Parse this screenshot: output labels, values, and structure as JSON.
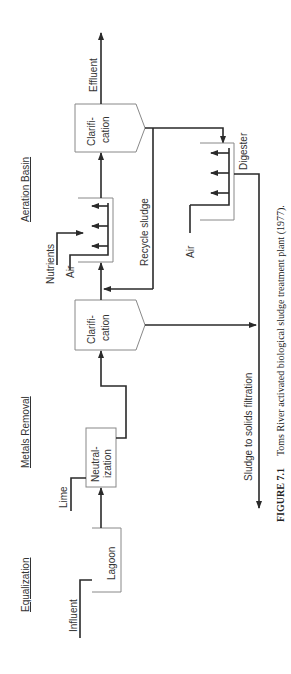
{
  "sections": {
    "equalization": "Equalization",
    "metals_removal": "Metals Removal",
    "aeration_basin": "Aeration Basin"
  },
  "units": {
    "lagoon": "Lagoon",
    "neutralization_1": "Neutral-",
    "neutralization_2": "ization",
    "clarifier_1_line1": "Clarifi-",
    "clarifier_1_line2": "cation",
    "clarifier_2_line1": "Clarifi-",
    "clarifier_2_line2": "cation",
    "digester": "Digester"
  },
  "streams": {
    "influent": "Influent",
    "lime": "Lime",
    "nutrients": "Nutrients",
    "air_aeration": "Air",
    "air_digester": "Air",
    "effluent": "Effluent",
    "recycle_sludge": "Recycle sludge",
    "sludge_filtration": "Sludge to solids filtration"
  },
  "caption": {
    "label": "FIGURE 7.1",
    "text": "Toms River activated biological sludge treatment plant (1977)."
  }
}
